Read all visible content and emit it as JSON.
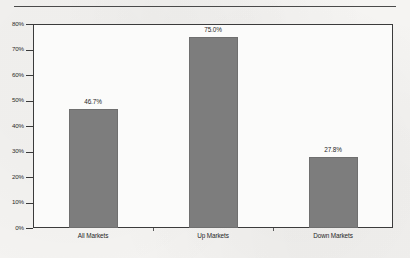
{
  "figure": {
    "background_color": "#f5f4f2",
    "plot_background_color": "#fbfbfa",
    "frame_color": "#3b3b3b",
    "bar_color": "#7d7d7d",
    "top_rule": "horizontal-rule"
  },
  "chart_data": {
    "type": "bar",
    "title": "",
    "subtitle": "",
    "xlabel": "",
    "ylabel": "",
    "categories": [
      "All Markets",
      "Up Markets",
      "Down Markets"
    ],
    "values": [
      46.7,
      75.0,
      27.8
    ],
    "value_labels": [
      "46.7%",
      "75.0%",
      "27.8%"
    ],
    "ylim": [
      0,
      80
    ],
    "ytick_values": [
      0,
      10,
      20,
      30,
      40,
      50,
      60,
      70,
      80
    ],
    "ytick_labels": [
      "0%",
      "10%",
      "20%",
      "30%",
      "40%",
      "50%",
      "60%",
      "70%",
      "80%"
    ],
    "grid": false,
    "legend": null,
    "legend_position": "none",
    "units": "percent",
    "orientation": "vertical",
    "series": [
      {
        "name": "",
        "values": [
          46.7,
          75.0,
          27.8
        ],
        "color": "#7d7d7d"
      }
    ]
  }
}
